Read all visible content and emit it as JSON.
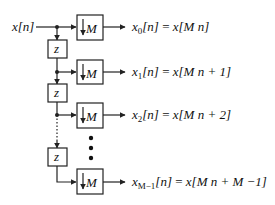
{
  "diagram": {
    "type": "polyphase-decomposition",
    "input_label": "x[n]",
    "delay_label": "z",
    "downsampler_label": "M",
    "downsampler_symbol": "down-arrow",
    "continuation": "vertical-ellipsis",
    "outputs": [
      {
        "lhs_base": "x",
        "lhs_sub": "0",
        "lhs_arg": "[n]",
        "eq": "=",
        "rhs": "x[M n]"
      },
      {
        "lhs_base": "x",
        "lhs_sub": "1",
        "lhs_arg": "[n]",
        "eq": "=",
        "rhs": "x[M n + 1]"
      },
      {
        "lhs_base": "x",
        "lhs_sub": "2",
        "lhs_arg": "[n]",
        "eq": "=",
        "rhs": "x[M n + 2]"
      },
      {
        "lhs_base": "x",
        "lhs_sub": "M−1",
        "lhs_arg": "[n]",
        "eq": "=",
        "rhs": "x[M n + M −1]"
      }
    ],
    "colors": {
      "stroke": "#222222",
      "background": "#ffffff"
    }
  }
}
